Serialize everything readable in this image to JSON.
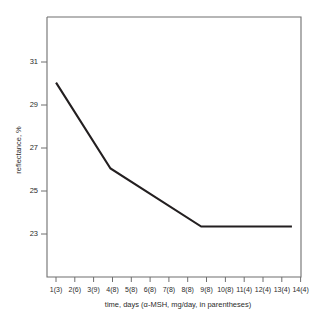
{
  "chart_data": {
    "type": "line",
    "title": "",
    "xlabel": "time, days (α-MSH, mg/day, in parentheses)",
    "ylabel": "reflectance, %",
    "categories": [
      "1(3)",
      "2(6)",
      "3(9)",
      "4(8)",
      "5(8)",
      "6(8)",
      "7(8)",
      "8(8)",
      "9(8)",
      "10(8)",
      "11(4)",
      "12(4)",
      "13(4)",
      "14(4)"
    ],
    "x": [
      1,
      2,
      3,
      4,
      5,
      6,
      7,
      8,
      9,
      10,
      11,
      12,
      13,
      14
    ],
    "values": [
      29.7,
      28.6,
      27.4,
      26.3,
      25.8,
      25.3,
      24.9,
      24.4,
      24.0,
      24.0,
      24.0,
      24.0,
      24.0,
      24.0
    ],
    "series": [
      {
        "name": "reflectance",
        "values": [
          29.7,
          28.6,
          27.4,
          26.3,
          25.8,
          25.3,
          24.9,
          24.4,
          24.0,
          24.0,
          24.0,
          24.0,
          24.0,
          24.0
        ]
      }
    ],
    "vertices": [
      {
        "x": 1,
        "y": 29.7
      },
      {
        "x": 4,
        "y": 26.3
      },
      {
        "x": 9,
        "y": 24.0
      },
      {
        "x": 14,
        "y": 24.0
      }
    ],
    "ylim": [
      22.0,
      32.3
    ],
    "xlim": [
      0.5,
      14.5
    ],
    "yticks": [
      23,
      25,
      27,
      29,
      31
    ],
    "ytick_labels": [
      "23",
      "25",
      "27",
      "29",
      "31"
    ],
    "xticks": [
      1,
      2,
      3,
      4,
      5,
      6,
      7,
      8,
      9,
      10,
      11,
      12,
      13,
      14
    ],
    "grid": false,
    "legend": null,
    "line_color": "#231f20",
    "frame_color": "#6f6f6f",
    "background": "#ffffff"
  }
}
